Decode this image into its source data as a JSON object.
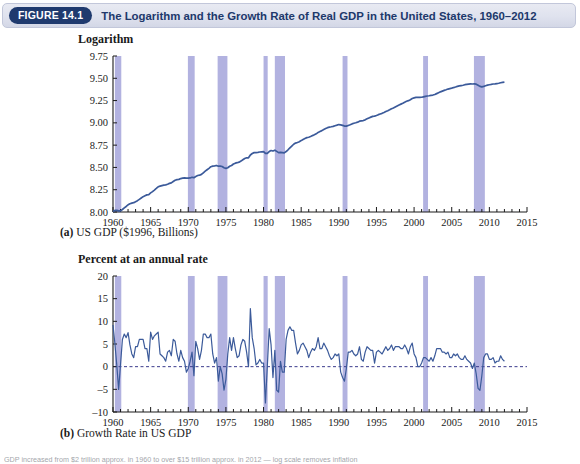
{
  "header": {
    "badge": "FIGURE 14.1",
    "title": "The Logarithm and the Growth Rate of Real GDP in the United States, 1960–2012",
    "badge_color": "#1f3a6e",
    "bar_color": "#dfe2ee",
    "title_color": "#20386b"
  },
  "footnote": {
    "text": "GDP increased from $2 trillion approx. in 1960 to over $15 trillion approx. in 2012 — log scale removes inflation"
  },
  "colors": {
    "line": "#3b5a9a",
    "recession_band": "#b2b2e0",
    "axis": "#1a1a1a",
    "zero_line": "#3b3b8c"
  },
  "chart_data": [
    {
      "type": "line",
      "id": "panel-a",
      "title": "Logarithm",
      "caption_prefix": "(a)",
      "caption": "US GDP ($1996, Billions)",
      "xlabel": "",
      "ylabel": "Logarithm",
      "xlim": [
        1960,
        2015
      ],
      "ylim": [
        8.0,
        9.75
      ],
      "ytick_labels": [
        "9.75",
        "9.50",
        "9.25",
        "9.00",
        "8.75",
        "8.50",
        "8.25",
        "8.00"
      ],
      "yticks": [
        9.75,
        9.5,
        9.25,
        9.0,
        8.75,
        8.5,
        8.25,
        8.0
      ],
      "xtick_labels": [
        "1960",
        "1965",
        "1970",
        "1975",
        "1980",
        "1985",
        "1990",
        "1995",
        "2000",
        "2005",
        "2010",
        "2015"
      ],
      "xticks": [
        1960,
        1965,
        1970,
        1975,
        1980,
        1985,
        1990,
        1995,
        2000,
        2005,
        2010,
        2015
      ],
      "minor_tick_interval": 1,
      "grid": false,
      "legend": "none",
      "x": [
        1960.0,
        1960.25,
        1960.5,
        1960.75,
        1961.0,
        1961.25,
        1961.5,
        1961.75,
        1962.0,
        1962.25,
        1962.5,
        1962.75,
        1963.0,
        1963.25,
        1963.5,
        1963.75,
        1964.0,
        1964.25,
        1964.5,
        1964.75,
        1965.0,
        1965.25,
        1965.5,
        1965.75,
        1966.0,
        1966.25,
        1966.5,
        1966.75,
        1967.0,
        1967.25,
        1967.5,
        1967.75,
        1968.0,
        1968.25,
        1968.5,
        1968.75,
        1969.0,
        1969.25,
        1969.5,
        1969.75,
        1970.0,
        1970.25,
        1970.5,
        1970.75,
        1971.0,
        1971.25,
        1971.5,
        1971.75,
        1972.0,
        1972.25,
        1972.5,
        1972.75,
        1973.0,
        1973.25,
        1973.5,
        1973.75,
        1974.0,
        1974.25,
        1974.5,
        1974.75,
        1975.0,
        1975.25,
        1975.5,
        1975.75,
        1976.0,
        1976.25,
        1976.5,
        1976.75,
        1977.0,
        1977.25,
        1977.5,
        1977.75,
        1978.0,
        1978.25,
        1978.5,
        1978.75,
        1979.0,
        1979.25,
        1979.5,
        1979.75,
        1980.0,
        1980.25,
        1980.5,
        1980.75,
        1981.0,
        1981.25,
        1981.5,
        1981.75,
        1982.0,
        1982.25,
        1982.5,
        1982.75,
        1983.0,
        1983.25,
        1983.5,
        1983.75,
        1984.0,
        1984.25,
        1984.5,
        1984.75,
        1985.0,
        1985.25,
        1985.5,
        1985.75,
        1986.0,
        1986.25,
        1986.5,
        1986.75,
        1987.0,
        1987.25,
        1987.5,
        1987.75,
        1988.0,
        1988.25,
        1988.5,
        1988.75,
        1989.0,
        1989.25,
        1989.5,
        1989.75,
        1990.0,
        1990.25,
        1990.5,
        1990.75,
        1991.0,
        1991.25,
        1991.5,
        1991.75,
        1992.0,
        1992.25,
        1992.5,
        1992.75,
        1993.0,
        1993.25,
        1993.5,
        1993.75,
        1994.0,
        1994.25,
        1994.5,
        1994.75,
        1995.0,
        1995.25,
        1995.5,
        1995.75,
        1996.0,
        1996.25,
        1996.5,
        1996.75,
        1997.0,
        1997.25,
        1997.5,
        1997.75,
        1998.0,
        1998.25,
        1998.5,
        1998.75,
        1999.0,
        1999.25,
        1999.5,
        1999.75,
        2000.0,
        2000.25,
        2000.5,
        2000.75,
        2001.0,
        2001.25,
        2001.5,
        2001.75,
        2002.0,
        2002.25,
        2002.5,
        2002.75,
        2003.0,
        2003.25,
        2003.5,
        2003.75,
        2004.0,
        2004.25,
        2004.5,
        2004.75,
        2005.0,
        2005.25,
        2005.5,
        2005.75,
        2006.0,
        2006.25,
        2006.5,
        2006.75,
        2007.0,
        2007.25,
        2007.5,
        2007.75,
        2008.0,
        2008.25,
        2008.5,
        2008.75,
        2009.0,
        2009.25,
        2009.5,
        2009.75,
        2010.0,
        2010.25,
        2010.5,
        2010.75,
        2011.0,
        2011.25,
        2011.5,
        2011.75,
        2012.0,
        2012.25,
        2012.5
      ],
      "y": [
        8.005,
        8.018,
        8.019,
        8.012,
        8.013,
        8.028,
        8.046,
        8.062,
        8.081,
        8.093,
        8.1,
        8.105,
        8.116,
        8.127,
        8.142,
        8.157,
        8.172,
        8.182,
        8.192,
        8.195,
        8.214,
        8.229,
        8.246,
        8.264,
        8.283,
        8.29,
        8.296,
        8.301,
        8.304,
        8.312,
        8.321,
        8.327,
        8.342,
        8.356,
        8.363,
        8.366,
        8.375,
        8.38,
        8.383,
        8.38,
        8.379,
        8.382,
        8.39,
        8.385,
        8.399,
        8.409,
        8.413,
        8.422,
        8.44,
        8.458,
        8.474,
        8.49,
        8.508,
        8.515,
        8.517,
        8.522,
        8.514,
        8.514,
        8.51,
        8.497,
        8.49,
        8.497,
        8.513,
        8.522,
        8.538,
        8.548,
        8.553,
        8.559,
        8.571,
        8.586,
        8.6,
        8.608,
        8.608,
        8.64,
        8.656,
        8.666,
        8.667,
        8.669,
        8.673,
        8.675,
        8.677,
        8.657,
        8.657,
        8.678,
        8.69,
        8.684,
        8.693,
        8.68,
        8.666,
        8.669,
        8.666,
        8.663,
        8.678,
        8.698,
        8.72,
        8.74,
        8.76,
        8.773,
        8.78,
        8.789,
        8.801,
        8.814,
        8.825,
        8.834,
        8.839,
        8.847,
        8.857,
        8.866,
        8.877,
        8.893,
        8.903,
        8.913,
        8.926,
        8.937,
        8.946,
        8.952,
        8.956,
        8.961,
        8.968,
        8.974,
        8.981,
        8.978,
        8.972,
        8.964,
        8.963,
        8.971,
        8.979,
        8.988,
        8.995,
        9.001,
        9.008,
        9.019,
        9.023,
        9.026,
        9.034,
        9.045,
        9.055,
        9.064,
        9.073,
        9.075,
        9.083,
        9.092,
        9.1,
        9.107,
        9.116,
        9.127,
        9.136,
        9.146,
        9.158,
        9.167,
        9.178,
        9.189,
        9.2,
        9.21,
        9.22,
        9.232,
        9.242,
        9.249,
        9.26,
        9.273,
        9.28,
        9.285,
        9.285,
        9.285,
        9.287,
        9.292,
        9.297,
        9.301,
        9.304,
        9.309,
        9.312,
        9.318,
        9.328,
        9.338,
        9.348,
        9.356,
        9.364,
        9.371,
        9.379,
        9.384,
        9.389,
        9.396,
        9.402,
        9.409,
        9.414,
        9.418,
        9.422,
        9.428,
        9.432,
        9.435,
        9.437,
        9.436,
        9.438,
        9.434,
        9.422,
        9.409,
        9.404,
        9.409,
        9.416,
        9.423,
        9.427,
        9.431,
        9.436,
        9.438,
        9.441,
        9.444,
        9.45,
        9.454,
        9.457
      ],
      "recessions": [
        {
          "start": 1960.25,
          "end": 1961.1
        },
        {
          "start": 1969.95,
          "end": 1970.85
        },
        {
          "start": 1973.9,
          "end": 1975.2
        },
        {
          "start": 1980.0,
          "end": 1980.55
        },
        {
          "start": 1981.5,
          "end": 1982.85
        },
        {
          "start": 1990.5,
          "end": 1991.15
        },
        {
          "start": 2001.2,
          "end": 2001.85
        },
        {
          "start": 2007.95,
          "end": 2009.4
        }
      ],
      "recession_note": "Shaded vertical bands mark NBER recessions"
    },
    {
      "type": "line",
      "id": "panel-b",
      "title": "Percent at an annual rate",
      "caption_prefix": "(b)",
      "caption": "Growth Rate in US GDP",
      "xlabel": "",
      "ylabel": "Percent at an annual rate",
      "xlim": [
        1960,
        2015
      ],
      "ylim": [
        -10,
        20
      ],
      "ytick_labels": [
        "20",
        "15",
        "10",
        "5",
        "0",
        "–5",
        "–10"
      ],
      "yticks": [
        20,
        15,
        10,
        5,
        0,
        -5,
        -10
      ],
      "xtick_labels": [
        "1960",
        "1965",
        "1970",
        "1975",
        "1980",
        "1985",
        "1990",
        "1995",
        "2000",
        "2005",
        "2010",
        "2015"
      ],
      "xticks": [
        1960,
        1965,
        1970,
        1975,
        1980,
        1985,
        1990,
        1995,
        2000,
        2005,
        2010,
        2015
      ],
      "zero_line": 0,
      "zero_line_style": "dashed",
      "grid": false,
      "legend": "none",
      "x": [
        1960.0,
        1960.25,
        1960.5,
        1960.75,
        1961.0,
        1961.25,
        1961.5,
        1961.75,
        1962.0,
        1962.25,
        1962.5,
        1962.75,
        1963.0,
        1963.25,
        1963.5,
        1963.75,
        1964.0,
        1964.25,
        1964.5,
        1964.75,
        1965.0,
        1965.25,
        1965.5,
        1965.75,
        1966.0,
        1966.25,
        1966.5,
        1966.75,
        1967.0,
        1967.25,
        1967.5,
        1967.75,
        1968.0,
        1968.25,
        1968.5,
        1968.75,
        1969.0,
        1969.25,
        1969.5,
        1969.75,
        1970.0,
        1970.25,
        1970.5,
        1970.75,
        1971.0,
        1971.25,
        1971.5,
        1971.75,
        1972.0,
        1972.25,
        1972.5,
        1972.75,
        1973.0,
        1973.25,
        1973.5,
        1973.75,
        1974.0,
        1974.25,
        1974.5,
        1974.75,
        1975.0,
        1975.25,
        1975.5,
        1975.75,
        1976.0,
        1976.25,
        1976.5,
        1976.75,
        1977.0,
        1977.25,
        1977.5,
        1977.75,
        1978.0,
        1978.25,
        1978.5,
        1978.75,
        1979.0,
        1979.25,
        1979.5,
        1979.75,
        1980.0,
        1980.25,
        1980.5,
        1980.75,
        1981.0,
        1981.25,
        1981.5,
        1981.75,
        1982.0,
        1982.25,
        1982.5,
        1982.75,
        1983.0,
        1983.25,
        1983.5,
        1983.75,
        1984.0,
        1984.25,
        1984.5,
        1984.75,
        1985.0,
        1985.25,
        1985.5,
        1985.75,
        1986.0,
        1986.25,
        1986.5,
        1986.75,
        1987.0,
        1987.25,
        1987.5,
        1987.75,
        1988.0,
        1988.25,
        1988.5,
        1988.75,
        1989.0,
        1989.25,
        1989.5,
        1989.75,
        1990.0,
        1990.25,
        1990.5,
        1990.75,
        1991.0,
        1991.25,
        1991.5,
        1991.75,
        1992.0,
        1992.25,
        1992.5,
        1992.75,
        1993.0,
        1993.25,
        1993.5,
        1993.75,
        1994.0,
        1994.25,
        1994.5,
        1994.75,
        1995.0,
        1995.25,
        1995.5,
        1995.75,
        1996.0,
        1996.25,
        1996.5,
        1996.75,
        1997.0,
        1997.25,
        1997.5,
        1997.75,
        1998.0,
        1998.25,
        1998.5,
        1998.75,
        1999.0,
        1999.25,
        1999.5,
        1999.75,
        2000.0,
        2000.25,
        2000.5,
        2000.75,
        2001.0,
        2001.25,
        2001.5,
        2001.75,
        2002.0,
        2002.25,
        2002.5,
        2002.75,
        2003.0,
        2003.25,
        2003.5,
        2003.75,
        2004.0,
        2004.25,
        2004.5,
        2004.75,
        2005.0,
        2005.25,
        2005.5,
        2005.75,
        2006.0,
        2006.25,
        2006.5,
        2006.75,
        2007.0,
        2007.25,
        2007.5,
        2007.75,
        2008.0,
        2008.25,
        2008.5,
        2008.75,
        2009.0,
        2009.25,
        2009.5,
        2009.75,
        2010.0,
        2010.25,
        2010.5,
        2010.75,
        2011.0,
        2011.25,
        2011.5,
        2011.75,
        2012.0,
        2012.25,
        2012.5
      ],
      "y": [
        9.2,
        5.1,
        0.4,
        -5.0,
        0.5,
        6.0,
        7.2,
        6.4,
        7.5,
        4.8,
        2.8,
        2.0,
        4.4,
        4.4,
        6.0,
        6.0,
        6.0,
        4.0,
        4.0,
        1.2,
        7.6,
        6.0,
        6.8,
        7.2,
        7.6,
        2.8,
        2.4,
        2.0,
        1.2,
        3.2,
        3.6,
        2.4,
        6.0,
        5.6,
        2.8,
        1.2,
        3.6,
        2.0,
        1.2,
        -1.2,
        -0.4,
        1.2,
        3.2,
        -2.0,
        5.6,
        4.0,
        1.6,
        3.6,
        7.2,
        7.2,
        6.4,
        6.4,
        7.2,
        2.8,
        0.8,
        2.0,
        -3.2,
        0.0,
        -1.6,
        -5.2,
        -2.8,
        2.8,
        6.4,
        3.6,
        6.4,
        4.0,
        2.0,
        2.4,
        4.8,
        6.0,
        5.6,
        3.2,
        0.0,
        12.8,
        6.4,
        4.0,
        0.4,
        0.8,
        1.6,
        0.8,
        0.8,
        -8.0,
        0.0,
        8.4,
        4.8,
        -2.4,
        3.6,
        -5.2,
        -5.6,
        1.2,
        -1.2,
        -1.2,
        6.0,
        8.0,
        8.8,
        8.0,
        8.0,
        5.2,
        2.8,
        3.6,
        4.8,
        5.2,
        4.4,
        3.6,
        2.0,
        3.2,
        4.0,
        3.6,
        4.4,
        6.4,
        4.0,
        4.0,
        5.2,
        4.4,
        3.6,
        2.4,
        1.6,
        2.0,
        2.8,
        2.4,
        2.8,
        -1.2,
        -2.4,
        -3.2,
        -0.4,
        3.2,
        3.2,
        3.6,
        2.8,
        2.4,
        2.8,
        4.4,
        1.6,
        1.2,
        3.2,
        4.4,
        4.0,
        3.6,
        3.6,
        0.8,
        3.2,
        3.6,
        3.2,
        2.8,
        3.6,
        4.4,
        3.6,
        4.0,
        4.8,
        3.6,
        4.4,
        4.4,
        4.4,
        4.0,
        4.0,
        4.8,
        4.0,
        2.8,
        4.4,
        5.2,
        2.8,
        2.0,
        0.0,
        0.0,
        0.8,
        2.0,
        2.0,
        1.6,
        1.2,
        2.0,
        1.2,
        2.4,
        4.0,
        4.0,
        4.0,
        3.2,
        3.2,
        2.8,
        3.2,
        2.0,
        2.0,
        2.8,
        2.4,
        2.8,
        2.0,
        1.6,
        1.6,
        2.4,
        1.6,
        1.2,
        0.8,
        -0.4,
        0.8,
        -1.6,
        -4.8,
        -5.2,
        -2.0,
        2.0,
        2.8,
        2.8,
        1.6,
        1.6,
        2.0,
        0.8,
        1.2,
        1.2,
        2.4,
        1.6,
        1.2
      ],
      "recessions": [
        {
          "start": 1960.25,
          "end": 1961.1
        },
        {
          "start": 1969.95,
          "end": 1970.85
        },
        {
          "start": 1973.9,
          "end": 1975.2
        },
        {
          "start": 1980.0,
          "end": 1980.55
        },
        {
          "start": 1981.5,
          "end": 1982.85
        },
        {
          "start": 1990.5,
          "end": 1991.15
        },
        {
          "start": 2001.2,
          "end": 2001.85
        },
        {
          "start": 2007.95,
          "end": 2009.4
        }
      ],
      "recession_note": "Shaded vertical bands mark NBER recessions"
    }
  ]
}
